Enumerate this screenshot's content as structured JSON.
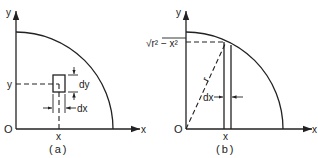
{
  "panel_a": {
    "caption": "(a)",
    "y_axis_label": "y",
    "x_axis_label": "x",
    "origin_label": "O",
    "point_x_label": "x",
    "point_y_label": "y",
    "dy_label": "dy",
    "dx_label": "dx"
  },
  "panel_b": {
    "caption": "(b)",
    "y_axis_label": "y",
    "x_axis_label": "x",
    "origin_label": "O",
    "point_x_label": "x",
    "height_label": "√r² − x²",
    "radius_label": "r",
    "dx_label": "dx"
  },
  "colors": {
    "ink": "#222222",
    "background": "#ffffff"
  }
}
